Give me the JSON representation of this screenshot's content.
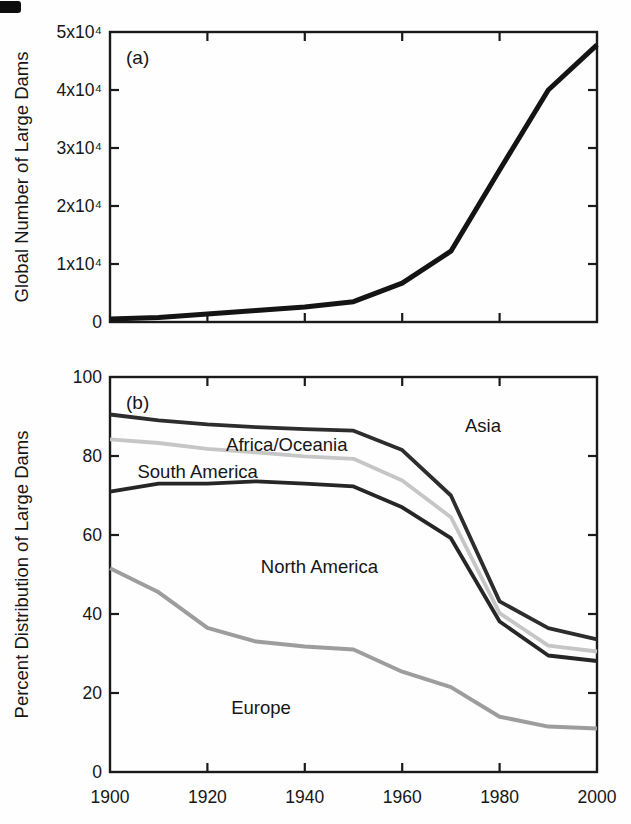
{
  "figure": {
    "background": "#fefefe",
    "axis_color": "#1a1a1a",
    "scan_artifact": "black-corner-mark"
  },
  "chart_data": [
    {
      "type": "line",
      "panel": "a",
      "panel_label": "(a)",
      "title": "",
      "xlabel": "",
      "ylabel": "Global Number of Large Dams",
      "grid": false,
      "legend": "none",
      "xlim": [
        1900,
        2000
      ],
      "ylim": [
        0,
        50000
      ],
      "x": [
        1900,
        1910,
        1920,
        1930,
        1940,
        1950,
        1960,
        1970,
        1980,
        1990,
        2000
      ],
      "xticks": [
        1920,
        1940,
        1960,
        1980
      ],
      "xtick_label_values": [],
      "xtick_labels": [],
      "yticks": [
        10000,
        20000,
        30000,
        40000
      ],
      "ytick_label_values": [
        0,
        10000,
        20000,
        30000,
        40000,
        50000
      ],
      "ytick_labels": [
        "0",
        "1x10⁴",
        "2x10⁴",
        "3x10⁴",
        "4x10⁴",
        "5x10⁴"
      ],
      "series": [
        {
          "name": "global-number-of-large-dams",
          "color": "#141414",
          "width": 5,
          "values": [
            500,
            800,
            1400,
            2000,
            2600,
            3500,
            6700,
            12200,
            26200,
            40000,
            47800
          ]
        }
      ],
      "annotations": []
    },
    {
      "type": "line",
      "panel": "b",
      "panel_label": "(b)",
      "title": "",
      "xlabel": "",
      "ylabel": "Percent Distribution of Large Dams",
      "grid": false,
      "legend": "none",
      "xlim": [
        1900,
        2000
      ],
      "ylim": [
        0,
        100
      ],
      "x": [
        1900,
        1910,
        1920,
        1930,
        1940,
        1950,
        1960,
        1970,
        1980,
        1990,
        2000
      ],
      "xticks": [
        1920,
        1940,
        1960,
        1980
      ],
      "xtick_label_values": [
        1900,
        1920,
        1940,
        1960,
        1980,
        2000
      ],
      "xtick_labels": [
        "1900",
        "1920",
        "1940",
        "1960",
        "1980",
        "2000"
      ],
      "yticks": [
        20,
        40,
        60,
        80
      ],
      "ytick_label_values": [
        0,
        20,
        40,
        60,
        80,
        100
      ],
      "ytick_labels": [
        "0",
        "20",
        "40",
        "60",
        "80",
        "100"
      ],
      "series": [
        {
          "name": "africa-oceania-upper-boundary",
          "color": "#c6c6c6",
          "width": 3.8,
          "values": [
            84.2,
            83.3,
            81.8,
            80.9,
            79.9,
            79.3,
            73.8,
            64.5,
            40.2,
            32.0,
            30.5
          ]
        },
        {
          "name": "asia-upper-boundary",
          "color": "#2d2d2d",
          "width": 3.8,
          "values": [
            90.5,
            89.0,
            88.0,
            87.3,
            86.8,
            86.4,
            81.5,
            70.0,
            43.2,
            36.4,
            33.6
          ]
        },
        {
          "name": "south-america-upper-boundary",
          "color": "#262626",
          "width": 3.8,
          "values": [
            71.0,
            73.0,
            73.0,
            73.6,
            73.0,
            72.3,
            67.0,
            59.2,
            38.1,
            29.5,
            28.1
          ]
        },
        {
          "name": "europe-upper-boundary",
          "color": "#9d9d9d",
          "width": 4,
          "values": [
            51.6,
            45.5,
            36.5,
            33.0,
            31.8,
            31.0,
            25.4,
            21.5,
            14.0,
            11.5,
            11.0
          ]
        }
      ],
      "annotations": [
        {
          "text": "Asia",
          "x": 1976.6,
          "y": 87.7
        },
        {
          "text": "Africa/Oceania",
          "x": 1936.3,
          "y": 83.0
        },
        {
          "text": "South America",
          "x": 1918.0,
          "y": 76.0
        },
        {
          "text": "North America",
          "x": 1943.0,
          "y": 52.0
        },
        {
          "text": "Europe",
          "x": 1931.0,
          "y": 16.3
        }
      ]
    }
  ]
}
